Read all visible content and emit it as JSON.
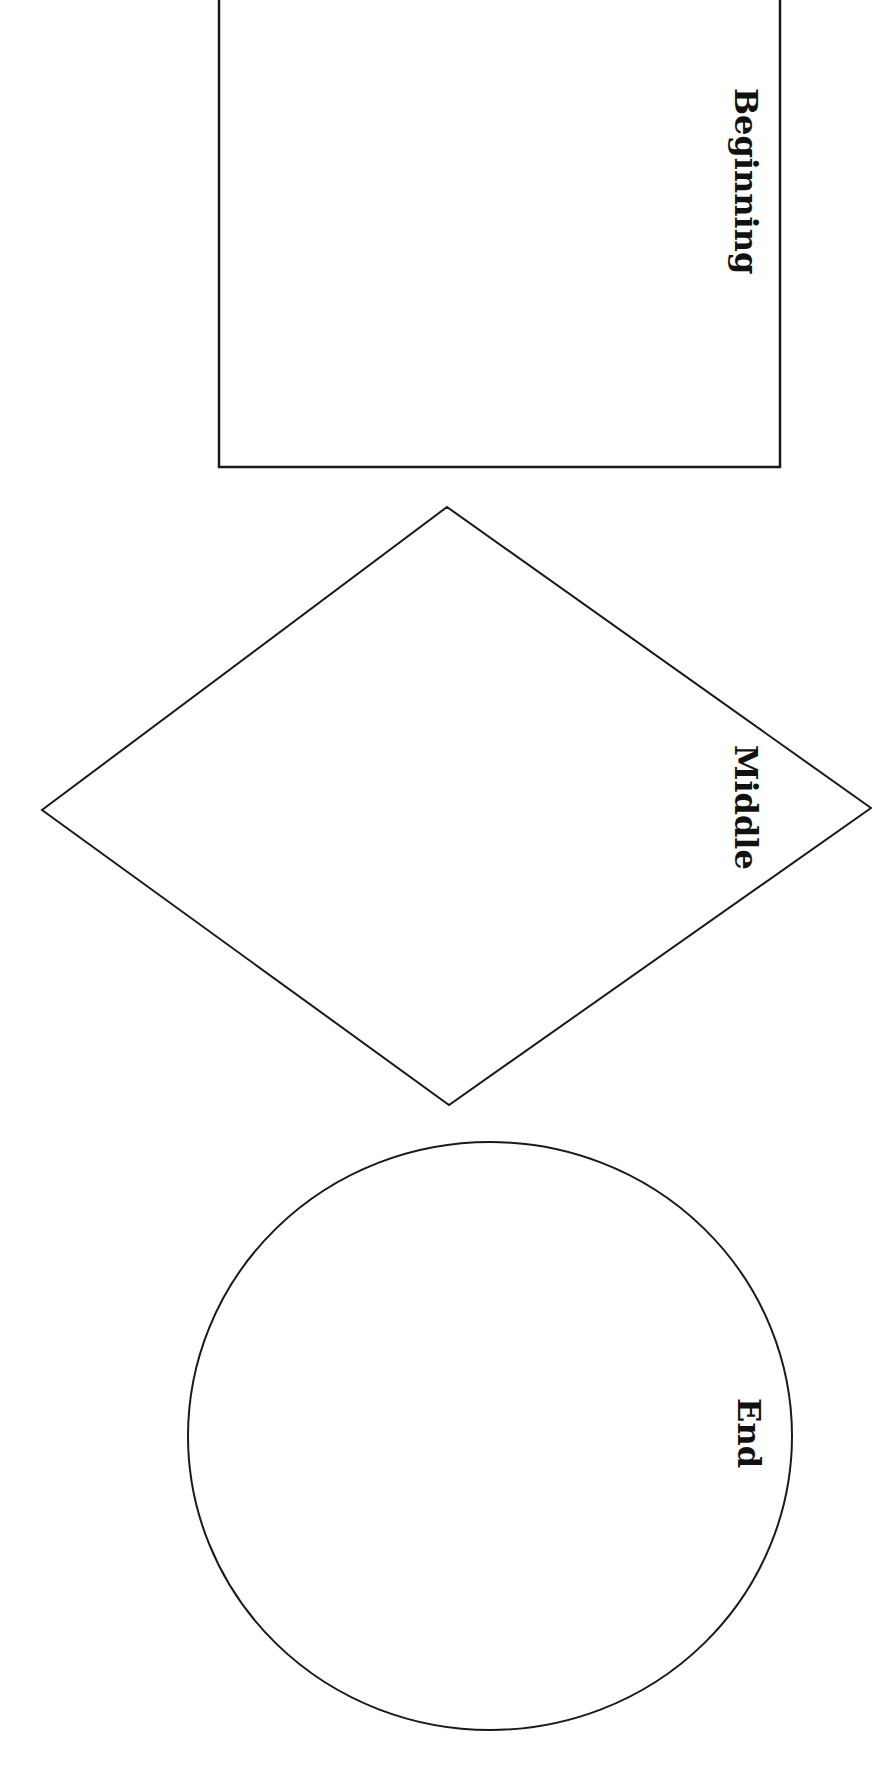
{
  "diagram": {
    "type": "graphic-organizer",
    "orientation": "rotated-90-clockwise",
    "shapes": [
      {
        "id": "beginning",
        "shape": "rectangle",
        "label": "Beginning"
      },
      {
        "id": "middle",
        "shape": "diamond",
        "label": "Middle"
      },
      {
        "id": "end",
        "shape": "ellipse",
        "label": "End"
      }
    ],
    "colors": {
      "stroke": "#1a1a1a",
      "background": "#ffffff",
      "text": "#111111"
    }
  }
}
